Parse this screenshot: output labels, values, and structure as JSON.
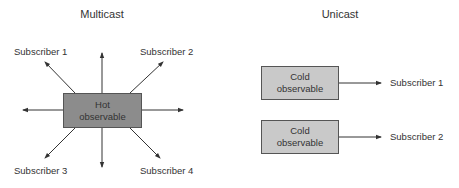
{
  "multicast": {
    "title": "Multicast",
    "source_box": {
      "line1": "Hot",
      "line2": "observable",
      "fill": "#8c8c8c"
    },
    "subscribers": [
      "Subscriber 1",
      "Subscriber 2",
      "Subscriber 3",
      "Subscriber 4"
    ]
  },
  "unicast": {
    "title": "Unicast",
    "pairs": [
      {
        "source_line1": "Cold",
        "source_line2": "observable",
        "subscriber": "Subscriber 1"
      },
      {
        "source_line1": "Cold",
        "source_line2": "observable",
        "subscriber": "Subscriber 2"
      }
    ],
    "box_fill": "#c9c9c9"
  }
}
